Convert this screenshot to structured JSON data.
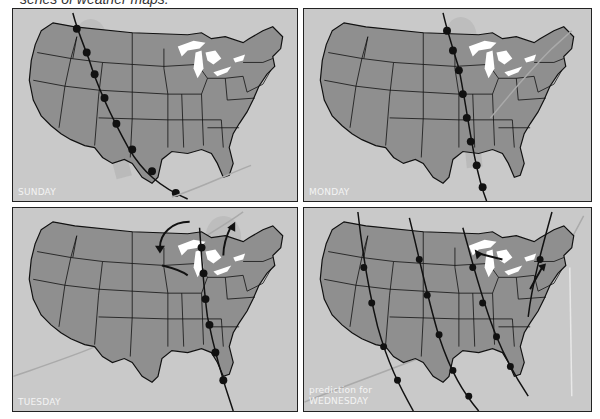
{
  "caption": "series of weather maps.",
  "colors": {
    "background": "#c9c9c9",
    "land": "#8f8f8f",
    "border": "#111111",
    "lakes": "#ffffff",
    "front_cold": "#111111",
    "front_faint": "#b3b3b3",
    "label_text": "#f4f4f4"
  },
  "panels": [
    {
      "id": "sunday",
      "label": "SUNDAY"
    },
    {
      "id": "monday",
      "label": "MONDAY"
    },
    {
      "id": "tuesday",
      "label": "TUESDAY"
    },
    {
      "id": "wednesday",
      "label_line1": "prediction for",
      "label_line2": "WEDNESDAY"
    }
  ],
  "icons": {
    "cold_front": "cold-front-line-with-semicircles",
    "warm_front": "faint-front-line-with-triangles",
    "wind_arrow": "curved-arrow"
  }
}
